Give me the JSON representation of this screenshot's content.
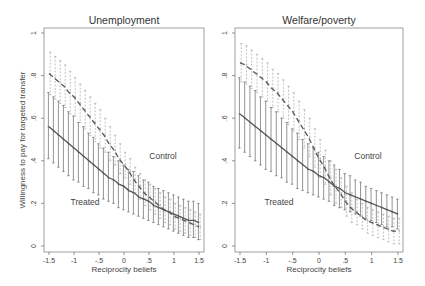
{
  "figure": {
    "ylabel": "Willingness to pay for targeted transfer",
    "panels": [
      {
        "title": "Unemployment",
        "xlabel": "Reciprocity beliefs",
        "label_control": "Control",
        "label_treated": "Treated"
      },
      {
        "title": "Welfare/poverty",
        "xlabel": "Reciprocity beliefs",
        "label_control": "Control",
        "label_treated": "Treated"
      }
    ],
    "xticks": [
      "-1.5",
      "-1",
      "-.5",
      "0",
      ".5",
      "1",
      "1.5"
    ],
    "yticks_left": [
      "0",
      ".2",
      ".4",
      ".6",
      ".8",
      "1"
    ],
    "yticks_right": [
      "0",
      ".2",
      ".4",
      ".6",
      ".8",
      "1"
    ],
    "colors": {
      "treated": "#555555",
      "control": "#555555",
      "control_ci": "#aaaaaa",
      "treated_ci": "#666666",
      "frame": "#888888"
    }
  },
  "chart_data": [
    {
      "type": "line",
      "title": "Unemployment",
      "xlabel": "Reciprocity beliefs",
      "ylabel": "Willingness to pay for targeted transfer",
      "xlim": [
        -1.5,
        1.5
      ],
      "ylim": [
        0,
        1
      ],
      "grid": false,
      "x": [
        -1.5,
        -1.4,
        -1.3,
        -1.2,
        -1.1,
        -1.0,
        -0.9,
        -0.8,
        -0.7,
        -0.6,
        -0.5,
        -0.4,
        -0.3,
        -0.2,
        -0.1,
        0.0,
        0.1,
        0.2,
        0.3,
        0.4,
        0.5,
        0.6,
        0.7,
        0.8,
        0.9,
        1.0,
        1.1,
        1.2,
        1.3,
        1.4,
        1.5
      ],
      "series": [
        {
          "name": "Control",
          "style": "dashed",
          "values": [
            0.81,
            0.79,
            0.77,
            0.75,
            0.72,
            0.7,
            0.67,
            0.64,
            0.61,
            0.58,
            0.55,
            0.52,
            0.48,
            0.45,
            0.41,
            0.38,
            0.35,
            0.31,
            0.28,
            0.25,
            0.23,
            0.21,
            0.19,
            0.17,
            0.16,
            0.14,
            0.13,
            0.12,
            0.11,
            0.1,
            0.09
          ],
          "ci_upper": [
            0.91,
            0.89,
            0.87,
            0.85,
            0.82,
            0.79,
            0.76,
            0.73,
            0.7,
            0.67,
            0.64,
            0.6,
            0.56,
            0.52,
            0.48,
            0.44,
            0.41,
            0.37,
            0.34,
            0.31,
            0.29,
            0.27,
            0.25,
            0.23,
            0.22,
            0.2,
            0.19,
            0.18,
            0.17,
            0.16,
            0.15
          ],
          "ci_lower": [
            0.71,
            0.69,
            0.67,
            0.65,
            0.62,
            0.61,
            0.58,
            0.55,
            0.52,
            0.49,
            0.46,
            0.44,
            0.4,
            0.38,
            0.34,
            0.32,
            0.29,
            0.25,
            0.22,
            0.19,
            0.17,
            0.15,
            0.13,
            0.11,
            0.1,
            0.08,
            0.07,
            0.06,
            0.05,
            0.04,
            0.03
          ]
        },
        {
          "name": "Treated",
          "style": "solid",
          "values": [
            0.56,
            0.54,
            0.52,
            0.5,
            0.48,
            0.46,
            0.44,
            0.42,
            0.4,
            0.38,
            0.36,
            0.34,
            0.32,
            0.31,
            0.29,
            0.28,
            0.26,
            0.25,
            0.23,
            0.22,
            0.21,
            0.19,
            0.18,
            0.17,
            0.16,
            0.15,
            0.14,
            0.13,
            0.12,
            0.12,
            0.11
          ],
          "ci_upper": [
            0.72,
            0.7,
            0.68,
            0.66,
            0.63,
            0.61,
            0.58,
            0.56,
            0.53,
            0.51,
            0.48,
            0.46,
            0.44,
            0.42,
            0.4,
            0.38,
            0.36,
            0.35,
            0.33,
            0.31,
            0.3,
            0.28,
            0.27,
            0.26,
            0.25,
            0.24,
            0.23,
            0.22,
            0.21,
            0.21,
            0.2
          ],
          "ci_lower": [
            0.41,
            0.39,
            0.37,
            0.35,
            0.33,
            0.31,
            0.3,
            0.28,
            0.27,
            0.25,
            0.24,
            0.22,
            0.21,
            0.2,
            0.18,
            0.17,
            0.16,
            0.15,
            0.14,
            0.13,
            0.12,
            0.11,
            0.1,
            0.09,
            0.08,
            0.07,
            0.06,
            0.05,
            0.04,
            0.04,
            0.03
          ]
        }
      ],
      "annotations": [
        {
          "text": "Control",
          "x": 0.85,
          "y": 0.42
        },
        {
          "text": "Treated",
          "x": -0.85,
          "y": 0.21
        }
      ]
    },
    {
      "type": "line",
      "title": "Welfare/poverty",
      "xlabel": "Reciprocity beliefs",
      "ylabel": "",
      "xlim": [
        -1.5,
        1.5
      ],
      "ylim": [
        0,
        1
      ],
      "grid": false,
      "x": [
        -1.5,
        -1.4,
        -1.3,
        -1.2,
        -1.1,
        -1.0,
        -0.9,
        -0.8,
        -0.7,
        -0.6,
        -0.5,
        -0.4,
        -0.3,
        -0.2,
        -0.1,
        0.0,
        0.1,
        0.2,
        0.3,
        0.4,
        0.5,
        0.6,
        0.7,
        0.8,
        0.9,
        1.0,
        1.1,
        1.2,
        1.3,
        1.4,
        1.5
      ],
      "series": [
        {
          "name": "Control",
          "style": "dashed",
          "values": [
            0.86,
            0.85,
            0.83,
            0.81,
            0.79,
            0.77,
            0.74,
            0.72,
            0.69,
            0.66,
            0.63,
            0.59,
            0.55,
            0.51,
            0.46,
            0.41,
            0.37,
            0.32,
            0.28,
            0.25,
            0.21,
            0.18,
            0.16,
            0.14,
            0.12,
            0.11,
            0.1,
            0.09,
            0.08,
            0.07,
            0.07
          ],
          "ci_upper": [
            0.95,
            0.94,
            0.92,
            0.9,
            0.88,
            0.86,
            0.83,
            0.81,
            0.78,
            0.75,
            0.72,
            0.68,
            0.64,
            0.6,
            0.55,
            0.5,
            0.45,
            0.4,
            0.36,
            0.32,
            0.28,
            0.25,
            0.22,
            0.2,
            0.18,
            0.17,
            0.16,
            0.15,
            0.14,
            0.13,
            0.13
          ],
          "ci_lower": [
            0.77,
            0.76,
            0.74,
            0.72,
            0.7,
            0.68,
            0.65,
            0.63,
            0.6,
            0.57,
            0.54,
            0.5,
            0.46,
            0.42,
            0.37,
            0.32,
            0.29,
            0.24,
            0.2,
            0.18,
            0.14,
            0.11,
            0.1,
            0.08,
            0.06,
            0.05,
            0.04,
            0.03,
            0.02,
            0.01,
            0.01
          ]
        },
        {
          "name": "Treated",
          "style": "solid",
          "values": [
            0.62,
            0.6,
            0.58,
            0.56,
            0.54,
            0.52,
            0.5,
            0.48,
            0.46,
            0.44,
            0.42,
            0.4,
            0.38,
            0.36,
            0.35,
            0.33,
            0.32,
            0.3,
            0.28,
            0.27,
            0.25,
            0.24,
            0.23,
            0.22,
            0.21,
            0.2,
            0.19,
            0.18,
            0.17,
            0.16,
            0.15
          ],
          "ci_upper": [
            0.79,
            0.77,
            0.75,
            0.73,
            0.7,
            0.68,
            0.65,
            0.63,
            0.6,
            0.58,
            0.55,
            0.53,
            0.5,
            0.48,
            0.46,
            0.44,
            0.42,
            0.4,
            0.38,
            0.36,
            0.34,
            0.33,
            0.31,
            0.3,
            0.28,
            0.27,
            0.26,
            0.25,
            0.24,
            0.23,
            0.22
          ],
          "ci_lower": [
            0.46,
            0.44,
            0.42,
            0.4,
            0.38,
            0.36,
            0.35,
            0.33,
            0.32,
            0.3,
            0.29,
            0.27,
            0.26,
            0.25,
            0.24,
            0.23,
            0.22,
            0.21,
            0.19,
            0.18,
            0.17,
            0.16,
            0.15,
            0.14,
            0.13,
            0.12,
            0.11,
            0.1,
            0.09,
            0.09,
            0.08
          ]
        }
      ],
      "annotations": [
        {
          "text": "Control",
          "x": 0.9,
          "y": 0.42
        },
        {
          "text": "Treated",
          "x": -0.85,
          "y": 0.21
        }
      ]
    }
  ]
}
